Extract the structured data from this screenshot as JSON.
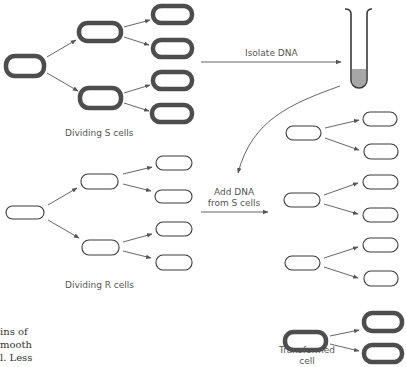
{
  "diagram": {
    "labels": {
      "s_cells": "Dividing S cells",
      "r_cells": "Dividing R cells",
      "isolate": "Isolate DNA",
      "add_dna_line1": "Add DNA",
      "add_dna_line2": "from S cells",
      "transformed_line1": "Transformed",
      "transformed_line2": "cell"
    },
    "caption_fragment": {
      "line1": "ins of",
      "line2": "mooth",
      "line3": "l. Less"
    },
    "colors": {
      "s_cell_stroke": "#4a4a4a",
      "r_cell_stroke": "#3a3a3a",
      "arrow": "#555555",
      "tube_liquid": "#a6a6a6",
      "label_text": "#555555"
    }
  }
}
